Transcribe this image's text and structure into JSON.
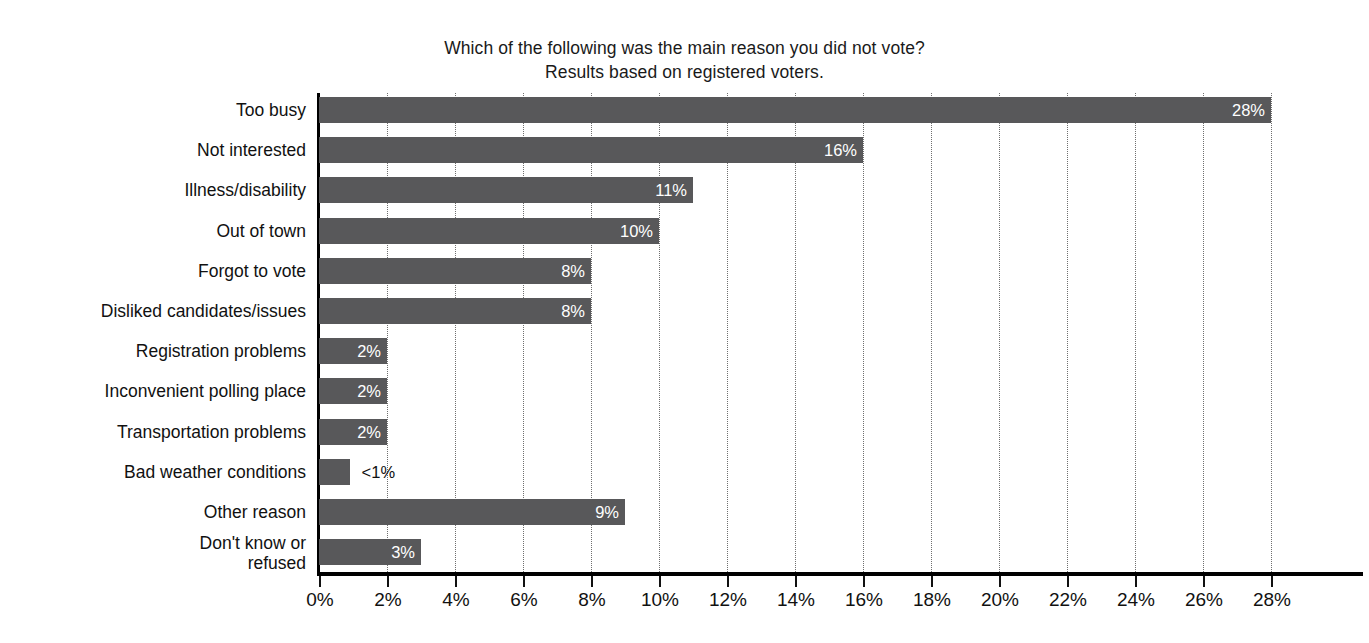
{
  "chart": {
    "title_line1": "Which of the following was the main reason you did not vote?",
    "title_line2": "Results based on registered voters."
  },
  "chart_data": {
    "type": "bar",
    "orientation": "horizontal",
    "title": "Which of the following was the main reason you did not vote? Results based on registered voters.",
    "subtitle": "Results based on registered voters.",
    "xlabel": "",
    "ylabel": "",
    "xlim": [
      0,
      28
    ],
    "xticks": [
      "0%",
      "2%",
      "4%",
      "6%",
      "8%",
      "10%",
      "12%",
      "14%",
      "16%",
      "18%",
      "20%",
      "22%",
      "24%",
      "26%",
      "28%"
    ],
    "xtick_values": [
      0,
      2,
      4,
      6,
      8,
      10,
      12,
      14,
      16,
      18,
      20,
      22,
      24,
      26,
      28
    ],
    "grid": "vertical-dotted",
    "legend": "none",
    "bar_color": "#58585a",
    "categories": [
      "Too busy",
      "Not interested",
      "Illness/disability",
      "Out of town",
      "Forgot to vote",
      "Disliked candidates/issues",
      "Registration problems",
      "Inconvenient polling place",
      "Transportation problems",
      "Bad weather conditions",
      "Other reason",
      "Don't know or\nrefused"
    ],
    "values": [
      28,
      16,
      11,
      10,
      8,
      8,
      2,
      2,
      2,
      0.9,
      9,
      3
    ],
    "labels": [
      "28%",
      "16%",
      "11%",
      "10%",
      "8%",
      "8%",
      "2%",
      "2%",
      "2%",
      "<1%",
      "9%",
      "3%"
    ],
    "label_placement": [
      "inside",
      "inside",
      "inside",
      "inside",
      "inside",
      "inside",
      "inside",
      "inside",
      "inside",
      "outside",
      "inside",
      "inside"
    ]
  }
}
